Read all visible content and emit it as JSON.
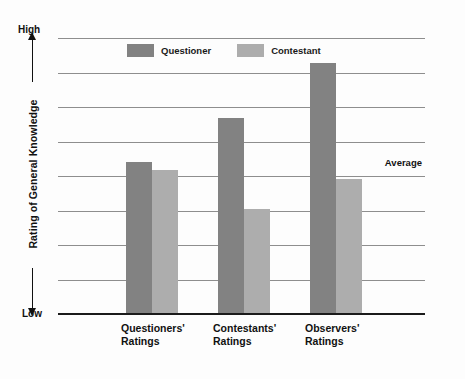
{
  "chart_data": {
    "type": "bar",
    "title": "",
    "xlabel": "",
    "ylabel": "Rating of General Knowledge",
    "axis_top_label": "High",
    "axis_bottom_label": "Low",
    "grid": true,
    "gridline_count": 8,
    "legend_position": "top-center",
    "categories": [
      "Questioners'\nRatings",
      "Contestants'\nRatings",
      "Observers'\nRatings"
    ],
    "category_lines": [
      [
        "Questioners'",
        "Ratings"
      ],
      [
        "Contestants'",
        "Ratings"
      ],
      [
        "Observers'",
        "Ratings"
      ]
    ],
    "series": [
      {
        "name": "Questioner",
        "color": "#828282",
        "values": [
          55,
          71,
          91
        ]
      },
      {
        "name": "Contestant",
        "color": "#adadad",
        "values": [
          52,
          38,
          49
        ]
      }
    ],
    "ylim": [
      0,
      100
    ],
    "annotations": [
      {
        "label": "Average",
        "value": 52,
        "position": "right"
      }
    ]
  },
  "legend": {
    "items": [
      {
        "label": "Questioner",
        "swatch": "questioner-swatch"
      },
      {
        "label": "Contestant",
        "swatch": "contestant-swatch"
      }
    ]
  },
  "colors": {
    "questioner": "#828282",
    "contestant": "#adadad",
    "gridline": "#8e8e8e",
    "axis": "#1b1b1b",
    "background": "#fdfdfd"
  }
}
